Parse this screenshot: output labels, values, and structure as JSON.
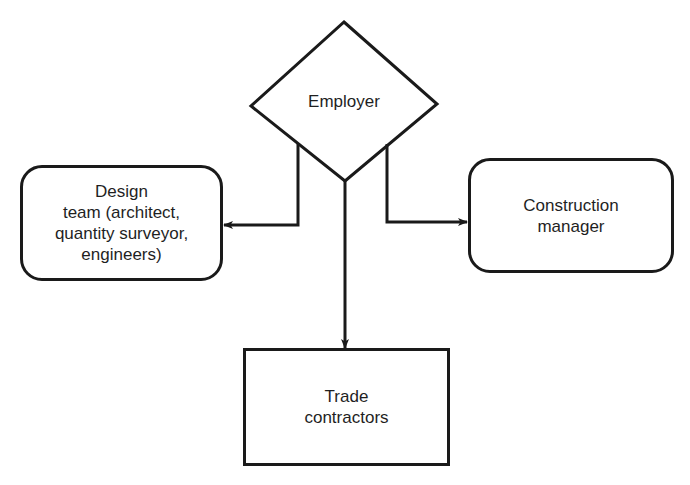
{
  "diagram": {
    "type": "organisational-relationship",
    "nodes": [
      {
        "id": "employer",
        "shape": "diamond",
        "label": "Employer"
      },
      {
        "id": "design_team",
        "shape": "rounded-rect",
        "label": "Design\nteam (architect,\nquantity surveyor,\nengineers)"
      },
      {
        "id": "construction_manager",
        "shape": "rounded-rect",
        "label": "Construction\nmanager"
      },
      {
        "id": "trade_contractors",
        "shape": "rect",
        "label": "Trade\ncontractors"
      }
    ],
    "edges": [
      {
        "from": "employer",
        "to": "design_team",
        "arrow": "end"
      },
      {
        "from": "employer",
        "to": "construction_manager",
        "arrow": "end"
      },
      {
        "from": "employer",
        "to": "trade_contractors",
        "arrow": "end"
      }
    ]
  },
  "colors": {
    "line": "#1a1a1a",
    "background": "#ffffff",
    "text": "#1f1f1f"
  }
}
